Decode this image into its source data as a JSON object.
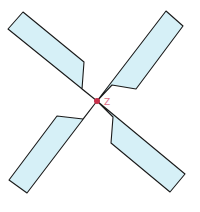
{
  "diagram": {
    "center": {
      "label": "Z",
      "x": 97,
      "y": 101,
      "color": "#c8304a"
    },
    "label_color": "#e0708a",
    "blade_fill": "#d6f0f7",
    "stroke_color": "#1a1a1a",
    "blades": [
      {
        "name": "top-left",
        "points": "97,101 82,89 84,62 23,12 8,29"
      },
      {
        "name": "top-right",
        "points": "97,101 112,85 136,89 183,26 166,11"
      },
      {
        "name": "bottom-left",
        "points": "97,101 83,119 57,116 9,180 27,193"
      },
      {
        "name": "bottom-right",
        "points": "97,101 113,117 111,143 170,192 185,174"
      }
    ]
  }
}
